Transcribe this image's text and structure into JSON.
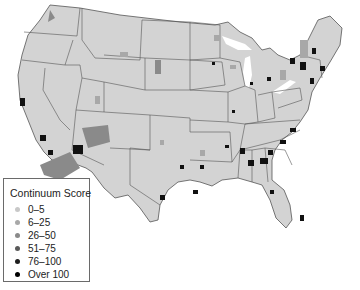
{
  "map": {
    "region": "Contiguous United States",
    "unit": "county",
    "base_fill": "#d3d3d3",
    "border_color": "#555555"
  },
  "legend": {
    "title": "Continuum Score",
    "items": [
      {
        "label": "0–5",
        "color": "#c8c8c8"
      },
      {
        "label": "6–25",
        "color": "#a8a8a8"
      },
      {
        "label": "26–50",
        "color": "#8a8a8a"
      },
      {
        "label": "51–75",
        "color": "#5a5a5a"
      },
      {
        "label": "76–100",
        "color": "#1e1e1e"
      },
      {
        "label": "Over 100",
        "color": "#000000"
      }
    ]
  }
}
